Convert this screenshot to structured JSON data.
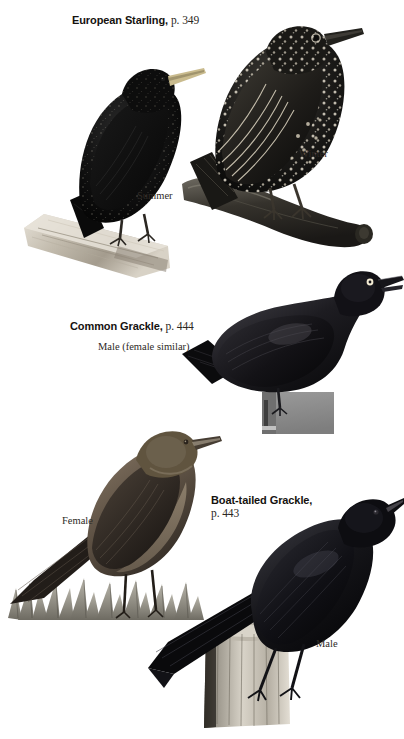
{
  "page": {
    "background_color": "#ffffff",
    "width": 404,
    "height": 739,
    "kind": "field-guide-plate"
  },
  "entries": [
    {
      "id": "european-starling",
      "name": "European Starling,",
      "page_ref": "p. 349",
      "captions": [
        "Summer",
        "Winter"
      ]
    },
    {
      "id": "common-grackle",
      "name": "Common Grackle,",
      "page_ref": "p. 444",
      "captions": [
        "Male (female similar)"
      ]
    },
    {
      "id": "boat-tailed-grackle",
      "name": "Boat-tailed Grackle,",
      "page_ref": "p. 443",
      "captions": [
        "Female",
        "Male"
      ]
    }
  ],
  "labels": {
    "starling_title_name": "European Starling,",
    "starling_title_page": "p. 349",
    "starling_summer": "Summer",
    "starling_winter": "Winter",
    "grackle_title_name": "Common Grackle,",
    "grackle_title_page": "p. 444",
    "grackle_sex": "Male (female similar)",
    "boat_title_name": "Boat-tailed Grackle,",
    "boat_title_page": "p. 443",
    "boat_female": "Female",
    "boat_male": "Male"
  },
  "figures": [
    {
      "name": "european-starling-summer",
      "subject": "European Starling in summer (breeding) plumage",
      "plumage": "glossy blackish body with fine pale speckling",
      "bill_color": "#c9bb8e",
      "body_color": "#101010",
      "perch": "angled pale driftwood branch"
    },
    {
      "name": "european-starling-winter",
      "subject": "European Starling in winter (nonbreeding) plumage",
      "plumage": "heavily white-spotted dark plumage with buff wing edgings",
      "bill_color": "#22211d",
      "body_color": "#161514",
      "perch": "dark horizontal log"
    },
    {
      "name": "common-grackle-male",
      "subject": "Common Grackle male",
      "plumage": "glossy iridescent black with pale yellow eye",
      "eye_color": "#f2ead2",
      "body_color": "#17161a",
      "perch": "grey rectangular block"
    },
    {
      "name": "boat-tailed-grackle-female",
      "subject": "Boat-tailed Grackle female",
      "plumage": "warm brown above, tawny buff below",
      "body_color": "#4d4239",
      "perch": "tuft of grass"
    },
    {
      "name": "boat-tailed-grackle-male",
      "subject": "Boat-tailed Grackle male",
      "plumage": "all glossy black with very long keel-shaped tail",
      "body_color": "#0c0c0e",
      "perch": "weathered wooden post"
    }
  ],
  "colors": {
    "ink": "#15120f",
    "serif_ink": "#2c2722",
    "block_grey": "#8c8c8c",
    "wood_pale": "#cfc8bb",
    "wood_dark": "#4a463f",
    "grass": "#8d8a80"
  }
}
